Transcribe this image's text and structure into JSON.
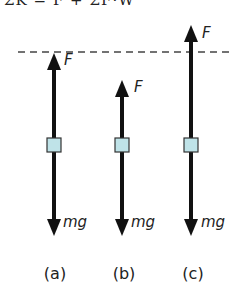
{
  "header": {
    "cropped_equation": "ΣK = F + ΣF·W"
  },
  "diagram": {
    "reference_line": {
      "style": "dashed",
      "y": 52
    },
    "colors": {
      "arrow": "#111111",
      "block_fill": "#bfe3e8",
      "block_stroke": "#333333"
    },
    "cases": [
      {
        "label": "(a)",
        "upward_force_label": "F",
        "downward_force_label": "mg",
        "x": 54,
        "force_tip_y": 53,
        "note": "F reaches dashed line"
      },
      {
        "label": "(b)",
        "upward_force_label": "F",
        "downward_force_label": "mg",
        "x": 122,
        "force_tip_y": 80,
        "note": "F below dashed line"
      },
      {
        "label": "(c)",
        "upward_force_label": "F",
        "downward_force_label": "mg",
        "x": 190,
        "force_tip_y": 25,
        "note": "F above dashed line"
      }
    ]
  }
}
